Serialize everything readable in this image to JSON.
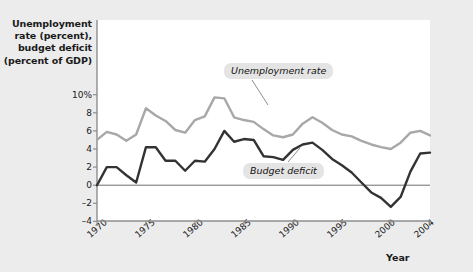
{
  "figure": {
    "background_color": "#ececed",
    "plot_background_color": "#ffffff"
  },
  "axes": {
    "y_title": "Unemployment rate (percent), budget deficit (percent of GDP)",
    "y_title_lines": [
      "Unemployment",
      "rate (percent),",
      "budget deficit",
      "(percent of GDP)"
    ],
    "x_title": "Year",
    "y_ticks": [
      {
        "value": 10,
        "label": "10%"
      },
      {
        "value": 8,
        "label": "8"
      },
      {
        "value": 6,
        "label": "6"
      },
      {
        "value": 4,
        "label": "4"
      },
      {
        "value": 2,
        "label": "2"
      },
      {
        "value": 0,
        "label": "0"
      },
      {
        "value": -2,
        "label": "–2"
      },
      {
        "value": -4,
        "label": "–4"
      }
    ],
    "x_ticks": [
      {
        "value": 1970,
        "label": "1970"
      },
      {
        "value": 1975,
        "label": "1975"
      },
      {
        "value": 1980,
        "label": "1980"
      },
      {
        "value": 1985,
        "label": "1985"
      },
      {
        "value": 1990,
        "label": "1990"
      },
      {
        "value": 1995,
        "label": "1995"
      },
      {
        "value": 2000,
        "label": "2000"
      },
      {
        "value": 2004,
        "label": "2004"
      }
    ]
  },
  "annotations": {
    "unemployment_label": "Unemployment rate",
    "budget_label": "Budget deficit"
  },
  "chart_data": {
    "type": "line",
    "title": "",
    "xlabel": "Year",
    "ylabel": "Unemployment rate (percent), budget deficit (percent of GDP)",
    "xlim": [
      1970,
      2004
    ],
    "ylim": [
      -4,
      11
    ],
    "grid": false,
    "legend": "inline-annotations",
    "zero_line": true,
    "x": [
      1970,
      1971,
      1972,
      1973,
      1974,
      1975,
      1976,
      1977,
      1978,
      1979,
      1980,
      1981,
      1982,
      1983,
      1984,
      1985,
      1986,
      1987,
      1988,
      1989,
      1990,
      1991,
      1992,
      1993,
      1994,
      1995,
      1996,
      1997,
      1998,
      1999,
      2000,
      2001,
      2002,
      2003,
      2004
    ],
    "series": [
      {
        "name": "Unemployment rate",
        "color": "#a8a8a8",
        "units": "percent",
        "values": [
          5.0,
          5.9,
          5.6,
          4.9,
          5.6,
          8.5,
          7.7,
          7.1,
          6.1,
          5.8,
          7.2,
          7.6,
          9.7,
          9.6,
          7.5,
          7.2,
          7.0,
          6.2,
          5.5,
          5.3,
          5.6,
          6.8,
          7.5,
          6.9,
          6.1,
          5.6,
          5.4,
          4.9,
          4.5,
          4.2,
          4.0,
          4.7,
          5.8,
          6.0,
          5.5
        ]
      },
      {
        "name": "Budget deficit",
        "color": "#333333",
        "units": "percent of GDP",
        "values": [
          0.0,
          2.0,
          2.0,
          1.1,
          0.3,
          4.2,
          4.2,
          2.7,
          2.7,
          1.6,
          2.7,
          2.6,
          4.0,
          6.0,
          4.8,
          5.1,
          5.0,
          3.2,
          3.1,
          2.8,
          3.9,
          4.5,
          4.7,
          3.9,
          2.9,
          2.2,
          1.4,
          0.3,
          -0.8,
          -1.4,
          -2.4,
          -1.3,
          1.5,
          3.5,
          3.6
        ]
      }
    ]
  }
}
